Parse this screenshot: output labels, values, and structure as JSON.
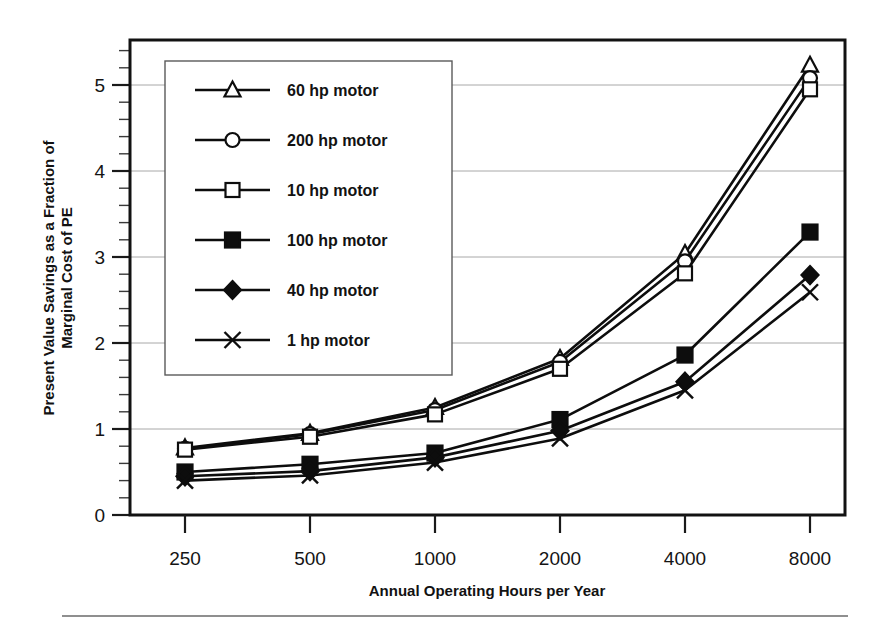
{
  "chart_data": {
    "type": "line",
    "title": "",
    "xlabel": "Annual Operating Hours per Year",
    "ylabel": "Present Value Savings as a Fraction of Marginal Cost of PE",
    "ylabel_line1": "Present Value Savings as a Fraction of",
    "ylabel_line2": "Marginal Cost of PE",
    "categories": [
      "250",
      "500",
      "1000",
      "2000",
      "4000",
      "8000"
    ],
    "x_tick_labels": [
      "250",
      "500",
      "1000",
      "2000",
      "4000",
      "8000"
    ],
    "y_tick_labels": [
      "0",
      "1",
      "2",
      "3",
      "4",
      "5"
    ],
    "ylim": [
      0,
      5.5
    ],
    "y_major_step": 1,
    "y_minor_step": 0.2,
    "grid": "horizontal",
    "legend_position": "upper-left-inside",
    "series": [
      {
        "name": "60 hp motor",
        "marker": "open-triangle",
        "values": [
          0.78,
          0.95,
          1.25,
          1.82,
          3.04,
          5.23
        ]
      },
      {
        "name": "200 hp motor",
        "marker": "open-circle",
        "values": [
          0.77,
          0.94,
          1.22,
          1.78,
          2.95,
          5.08
        ]
      },
      {
        "name": "10 hp motor",
        "marker": "open-square",
        "values": [
          0.76,
          0.91,
          1.17,
          1.7,
          2.81,
          4.95
        ]
      },
      {
        "name": "100 hp motor",
        "marker": "filled-square",
        "values": [
          0.5,
          0.59,
          0.72,
          1.11,
          1.86,
          3.29
        ]
      },
      {
        "name": "40 hp motor",
        "marker": "filled-diamond",
        "values": [
          0.45,
          0.51,
          0.67,
          0.98,
          1.55,
          2.79
        ]
      },
      {
        "name": "1 hp motor",
        "marker": "cross",
        "values": [
          0.4,
          0.46,
          0.61,
          0.89,
          1.45,
          2.59
        ]
      }
    ]
  },
  "legend": {
    "entries": [
      {
        "label": "60 hp motor",
        "marker": "open-triangle"
      },
      {
        "label": "200 hp motor",
        "marker": "open-circle"
      },
      {
        "label": "10 hp motor",
        "marker": "open-square"
      },
      {
        "label": "100 hp motor",
        "marker": "filled-square"
      },
      {
        "label": "40 hp motor",
        "marker": "filled-diamond"
      },
      {
        "label": "1 hp motor",
        "marker": "cross"
      }
    ]
  },
  "colors": {
    "ink": "#0d0d0d",
    "grid": "#a8a8a8",
    "frame": "#121212",
    "background": "#ffffff",
    "rule": "#8f8f8f"
  }
}
